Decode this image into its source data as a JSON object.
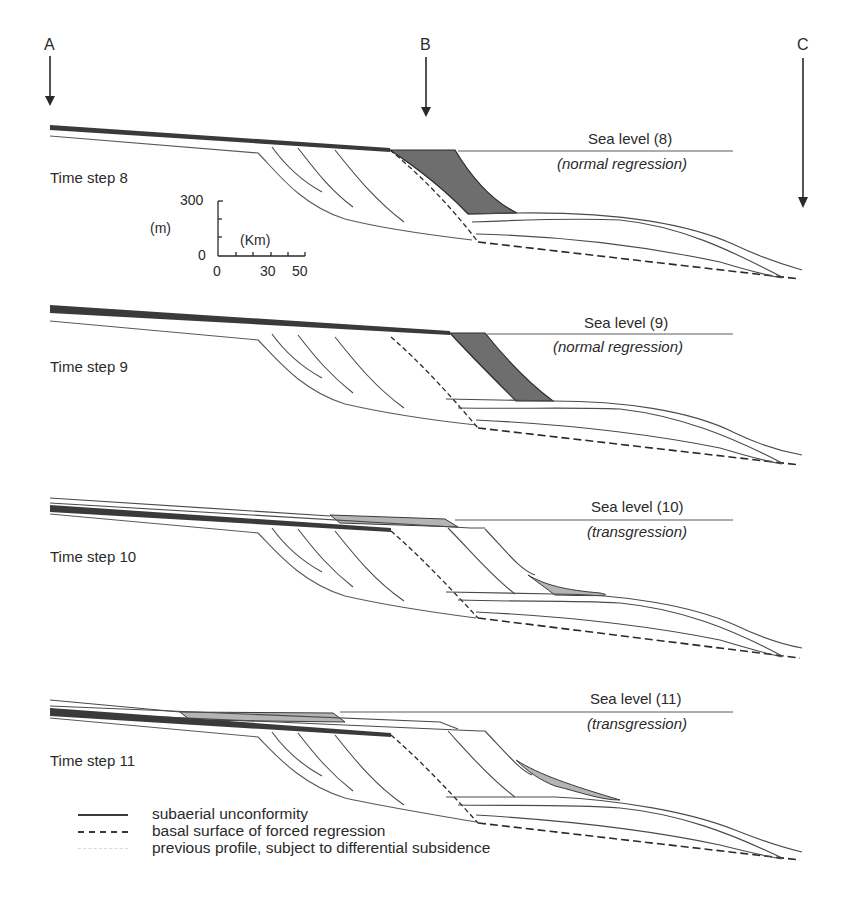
{
  "figure": {
    "type": "sequence-stratigraphy cross-section diagram",
    "section_markers": [
      {
        "label": "A"
      },
      {
        "label": "B"
      },
      {
        "label": "C"
      }
    ],
    "scale_bar": {
      "y_unit": "(m)",
      "y_ticks": [
        "300",
        "0"
      ],
      "x_unit": "(Km)",
      "x_ticks": [
        "0",
        "30",
        "50"
      ]
    },
    "panels": [
      {
        "time_step": "Time step 8",
        "sea_level": "Sea level (8)",
        "regime": "(normal regression)"
      },
      {
        "time_step": "Time step 9",
        "sea_level": "Sea level (9)",
        "regime": "(normal regression)"
      },
      {
        "time_step": "Time step 10",
        "sea_level": "Sea level (10)",
        "regime": "(transgression)"
      },
      {
        "time_step": "Time step 11",
        "sea_level": "Sea level (11)",
        "regime": "(transgression)"
      }
    ],
    "legend": [
      {
        "symbol": "solid-line",
        "label": "subaerial unconformity"
      },
      {
        "symbol": "dashed-line",
        "label": "basal surface of forced regression"
      },
      {
        "symbol": "faint-line",
        "label": "previous profile, subject to differential subsidence"
      }
    ],
    "colors": {
      "line": "#4a4a4a",
      "unconformity": "#3a3a3a",
      "regressive_fill": "#6e6e6e",
      "transgressive_fill": "#b4b4b4"
    }
  }
}
